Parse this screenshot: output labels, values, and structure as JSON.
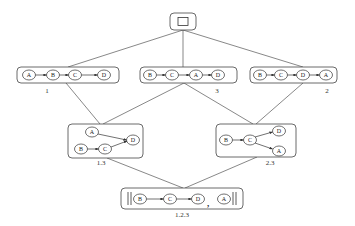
{
  "diagram": {
    "type": "lattice of partial orders",
    "top": {
      "symbol": "□"
    },
    "level1": [
      {
        "label": "1",
        "sequence": [
          "A",
          "B",
          "C",
          "D"
        ]
      },
      {
        "label": "3",
        "sequence": [
          "B",
          "C",
          "A",
          "D"
        ]
      },
      {
        "label": "2",
        "sequence": [
          "B",
          "C",
          "D",
          "A"
        ]
      }
    ],
    "level2": [
      {
        "label": "1.3",
        "nodes": [
          "A",
          "B",
          "C",
          "D"
        ],
        "edges": [
          [
            "A",
            "D"
          ],
          [
            "B",
            "C"
          ],
          [
            "C",
            "D"
          ]
        ]
      },
      {
        "label": "2.3",
        "nodes": [
          "B",
          "C",
          "D",
          "A"
        ],
        "edges": [
          [
            "B",
            "C"
          ],
          [
            "C",
            "D"
          ],
          [
            "C",
            "A"
          ]
        ]
      }
    ],
    "bottom": {
      "label": "1.2.3",
      "sequence": [
        "B",
        "C",
        "D"
      ],
      "separator": ",",
      "extra": "A"
    },
    "connections": [
      [
        "top",
        "1"
      ],
      [
        "top",
        "3"
      ],
      [
        "top",
        "2"
      ],
      [
        "1",
        "1.3"
      ],
      [
        "3",
        "1.3"
      ],
      [
        "3",
        "2.3"
      ],
      [
        "2",
        "2.3"
      ],
      [
        "1.3",
        "1.2.3"
      ],
      [
        "2.3",
        "1.2.3"
      ]
    ]
  }
}
